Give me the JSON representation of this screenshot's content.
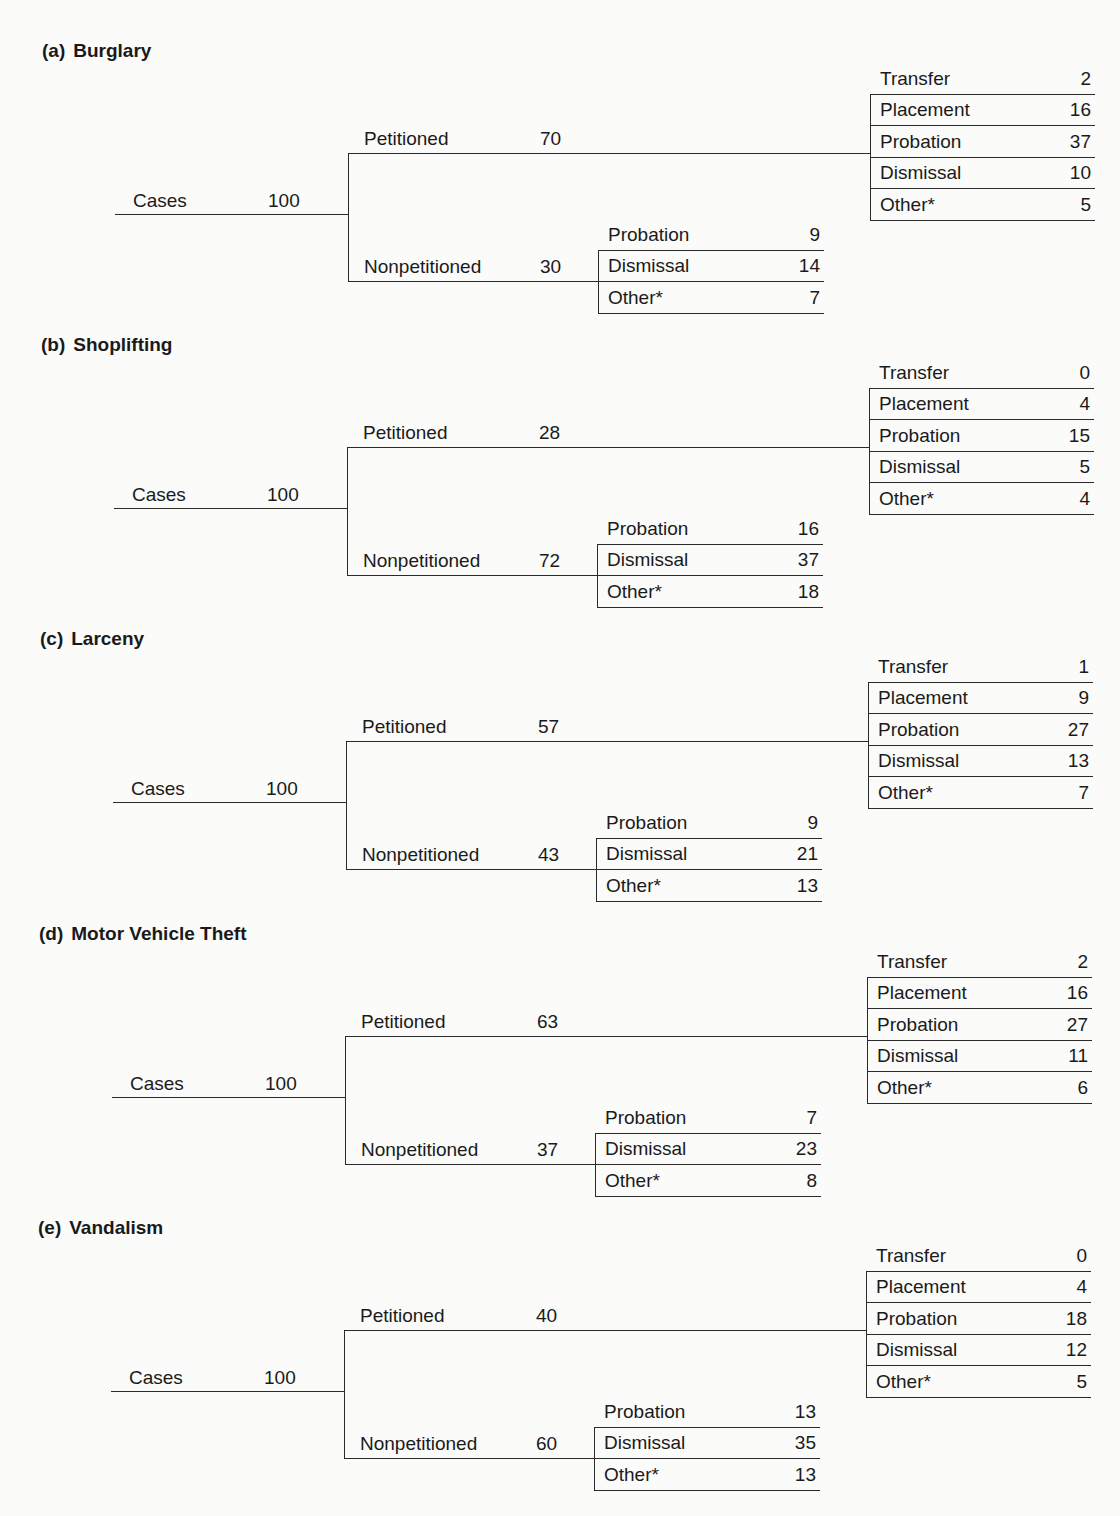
{
  "figure": {
    "total_label": "Cases",
    "petitioned_label": "Petitioned",
    "nonpetitioned_label": "Nonpetitioned",
    "sections": [
      {
        "letter": "(a)",
        "name": "Burglary",
        "cases": "100",
        "petitioned": "70",
        "nonpetitioned": "30",
        "petitioned_outcomes": [
          {
            "label": "Transfer",
            "value": "2"
          },
          {
            "label": "Placement",
            "value": "16"
          },
          {
            "label": "Probation",
            "value": "37"
          },
          {
            "label": "Dismissal",
            "value": "10"
          },
          {
            "label": "Other*",
            "value": "5"
          }
        ],
        "nonpetitioned_outcomes": [
          {
            "label": "Probation",
            "value": "9"
          },
          {
            "label": "Dismissal",
            "value": "14"
          },
          {
            "label": "Other*",
            "value": "7"
          }
        ]
      },
      {
        "letter": "(b)",
        "name": "Shoplifting",
        "cases": "100",
        "petitioned": "28",
        "nonpetitioned": "72",
        "petitioned_outcomes": [
          {
            "label": "Transfer",
            "value": "0"
          },
          {
            "label": "Placement",
            "value": "4"
          },
          {
            "label": "Probation",
            "value": "15"
          },
          {
            "label": "Dismissal",
            "value": "5"
          },
          {
            "label": "Other*",
            "value": "4"
          }
        ],
        "nonpetitioned_outcomes": [
          {
            "label": "Probation",
            "value": "16"
          },
          {
            "label": "Dismissal",
            "value": "37"
          },
          {
            "label": "Other*",
            "value": "18"
          }
        ]
      },
      {
        "letter": "(c)",
        "name": "Larceny",
        "cases": "100",
        "petitioned": "57",
        "nonpetitioned": "43",
        "petitioned_outcomes": [
          {
            "label": "Transfer",
            "value": "1"
          },
          {
            "label": "Placement",
            "value": "9"
          },
          {
            "label": "Probation",
            "value": "27"
          },
          {
            "label": "Dismissal",
            "value": "13"
          },
          {
            "label": "Other*",
            "value": "7"
          }
        ],
        "nonpetitioned_outcomes": [
          {
            "label": "Probation",
            "value": "9"
          },
          {
            "label": "Dismissal",
            "value": "21"
          },
          {
            "label": "Other*",
            "value": "13"
          }
        ]
      },
      {
        "letter": "(d)",
        "name": "Motor Vehicle Theft",
        "cases": "100",
        "petitioned": "63",
        "nonpetitioned": "37",
        "petitioned_outcomes": [
          {
            "label": "Transfer",
            "value": "2"
          },
          {
            "label": "Placement",
            "value": "16"
          },
          {
            "label": "Probation",
            "value": "27"
          },
          {
            "label": "Dismissal",
            "value": "11"
          },
          {
            "label": "Other*",
            "value": "6"
          }
        ],
        "nonpetitioned_outcomes": [
          {
            "label": "Probation",
            "value": "7"
          },
          {
            "label": "Dismissal",
            "value": "23"
          },
          {
            "label": "Other*",
            "value": "8"
          }
        ]
      },
      {
        "letter": "(e)",
        "name": "Vandalism",
        "cases": "100",
        "petitioned": "40",
        "nonpetitioned": "60",
        "petitioned_outcomes": [
          {
            "label": "Transfer",
            "value": "0"
          },
          {
            "label": "Placement",
            "value": "4"
          },
          {
            "label": "Probation",
            "value": "18"
          },
          {
            "label": "Dismissal",
            "value": "12"
          },
          {
            "label": "Other*",
            "value": "5"
          }
        ],
        "nonpetitioned_outcomes": [
          {
            "label": "Probation",
            "value": "13"
          },
          {
            "label": "Dismissal",
            "value": "35"
          },
          {
            "label": "Other*",
            "value": "13"
          }
        ]
      }
    ]
  }
}
